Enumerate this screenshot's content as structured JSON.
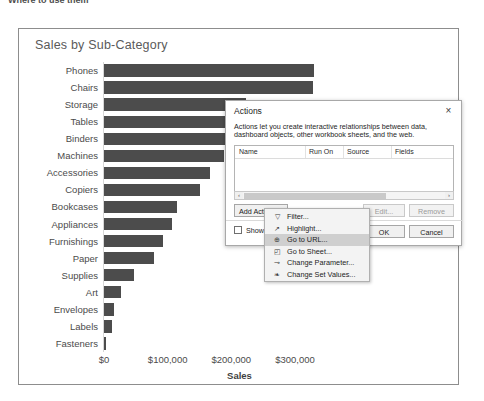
{
  "top_strip": {
    "text": "Where to use them"
  },
  "chart_card": {
    "title": "Sales by Sub-Category"
  },
  "chart_data": {
    "type": "bar",
    "orientation": "horizontal",
    "title": "Sales by Sub-Category",
    "xlabel": "Sales",
    "ylabel": "",
    "xlim": [
      0,
      330000
    ],
    "grid": false,
    "legend": null,
    "bar_color": "#4c4c4c",
    "xticks": [
      "$0",
      "$100,000",
      "$200,000",
      "$300,000"
    ],
    "xtick_values": [
      0,
      100000,
      200000,
      300000
    ],
    "categories": [
      "Phones",
      "Chairs",
      "Storage",
      "Tables",
      "Binders",
      "Machines",
      "Accessories",
      "Copiers",
      "Bookcases",
      "Appliances",
      "Furnishings",
      "Paper",
      "Supplies",
      "Art",
      "Envelopes",
      "Labels",
      "Fasteners"
    ],
    "values": [
      330000,
      328000,
      223000,
      207000,
      204000,
      189000,
      167000,
      150000,
      115000,
      107000,
      92000,
      78000,
      47000,
      27000,
      16000,
      12000,
      3000
    ]
  },
  "actions_dialog": {
    "title": "Actions",
    "close_icon": "×",
    "description": "Actions let you create interactive relationships between data, dashboard objects, other workbook sheets, and the web.",
    "table": {
      "columns": [
        "Name",
        "Run On",
        "Source",
        "Fields"
      ],
      "rows": []
    },
    "scrollbar": {
      "left_arrow": "‹",
      "right_arrow": "›"
    },
    "buttons": {
      "add_action": "Add Action",
      "add_action_caret": "»",
      "edit": "Edit...",
      "remove": "Remove",
      "ok": "OK",
      "cancel": "Cancel"
    },
    "show_action_label": "Show action"
  },
  "action_menu": {
    "items": [
      {
        "label": "Filter...",
        "icon": "▽",
        "selected": false
      },
      {
        "label": "Highlight...",
        "icon": "↗",
        "selected": false
      },
      {
        "label": "Go to URL...",
        "icon": "⊕",
        "selected": true
      },
      {
        "label": "Go to Sheet...",
        "icon": "◰",
        "selected": false
      },
      {
        "label": "Change Parameter...",
        "icon": "⊸",
        "selected": false
      },
      {
        "label": "Change Set Values...",
        "icon": "❧",
        "selected": false
      }
    ]
  }
}
